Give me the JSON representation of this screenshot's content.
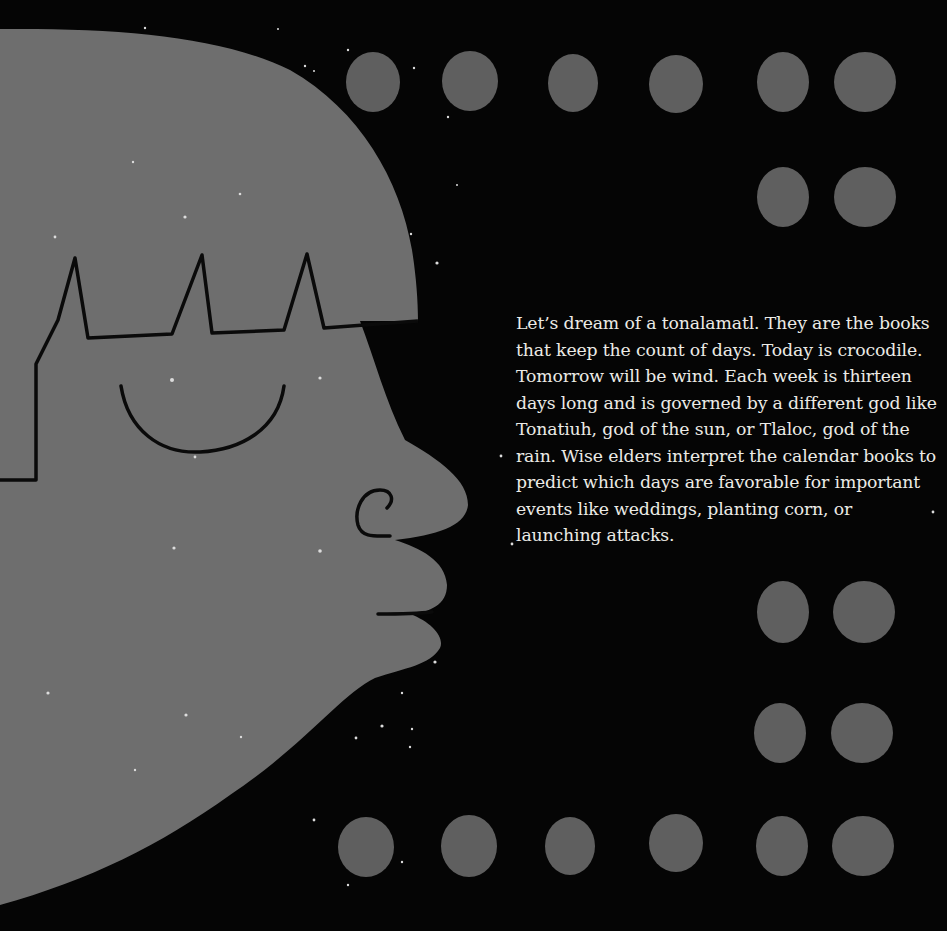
{
  "page": {
    "background_color": "#050505",
    "shape_color": "#6e6e6e",
    "line_color": "#0a0a0a",
    "text_color": "#ecebe6"
  },
  "illustration": {
    "subject": "stylized-face-profile-with-crown",
    "moons_top_row": 5,
    "moons_right_column": 4,
    "moons_bottom_row": 5
  },
  "story": {
    "lines": [
      "Let’s dream of a tonalamatl. They are the books",
      "that keep the count of days. Today is crocodile.",
      "Tomorrow will be wind.  Each week is thirteen",
      "days long and is governed by a different god like",
      "Tonatiuh, god of the sun, or Tlaloc, god of the",
      "rain. Wise elders interpret the calendar books to",
      "predict which days are favorable for important",
      "events like weddings, planting corn, or",
      "launching attacks."
    ]
  }
}
